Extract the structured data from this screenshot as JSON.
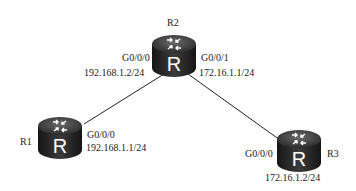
{
  "diagram": {
    "type": "network-topology",
    "routers": [
      {
        "id": "R1",
        "name": "R1",
        "icon": "router-icon",
        "glyph": "R"
      },
      {
        "id": "R2",
        "name": "R2",
        "icon": "router-icon",
        "glyph": "R"
      },
      {
        "id": "R3",
        "name": "R3",
        "icon": "router-icon",
        "glyph": "R"
      }
    ],
    "links": [
      {
        "from": "R1",
        "to": "R2"
      },
      {
        "from": "R2",
        "to": "R3"
      }
    ],
    "interfaces": {
      "r2_g0": {
        "name": "G0/0/0",
        "ip": "192.168.1.2/24"
      },
      "r2_g1": {
        "name": "G0/0/1",
        "ip": "172.16.1.1/24"
      },
      "r1_g0": {
        "name": "G0/0/0",
        "ip": "192.168.1.1/24"
      },
      "r3_g0": {
        "name": "G0/0/0",
        "ip": "172.16.1.2/24"
      }
    },
    "colors": {
      "router_top": "#3a3a3a",
      "router_body": "#1e1e1e",
      "link": "#222222",
      "text": "#1a1a1a"
    }
  }
}
